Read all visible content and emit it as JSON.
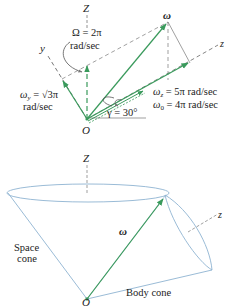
{
  "top_diagram": {
    "axis_Z": "Z",
    "axis_y": "y",
    "axis_z": "z",
    "origin": "O",
    "omega": "ω",
    "Omega_label_line1": "Ω = 2π",
    "Omega_label_line2": "rad/sec",
    "omega_y_line1": "ω",
    "omega_y_sub": "y",
    "omega_y_line1_rest": " = √3π",
    "omega_y_line2": "rad/sec",
    "omega_z_sym": "ω",
    "omega_z_sub": "z",
    "omega_z_rest": " = 5π rad/sec",
    "omega_0_sym": "ω",
    "omega_0_sub": "0",
    "omega_0_rest": " = 4π rad/sec",
    "gamma": "γ = 30°"
  },
  "bottom_diagram": {
    "axis_Z": "Z",
    "axis_z": "z",
    "omega": "ω",
    "origin": "O",
    "space_cone_line1": "Space",
    "space_cone_line2": "cone",
    "body_cone": "Body cone"
  },
  "colors": {
    "vector_green": "#3a9a5c",
    "cone_blue": "#8fb3d1",
    "guide_gray": "#888888"
  }
}
